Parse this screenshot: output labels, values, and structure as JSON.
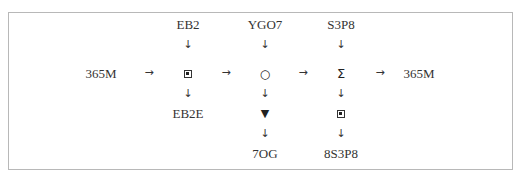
{
  "diagram": {
    "title_strip": "",
    "frame": {
      "border_color": "#b8b8b8"
    },
    "top_inputs": [
      {
        "id": "in-ebox",
        "label": "EB2"
      },
      {
        "id": "in-circle",
        "label": "YGO7"
      },
      {
        "id": "in-sigma",
        "label": "S3P8"
      }
    ],
    "main_row": {
      "start_label": "365M",
      "end_label": "365M",
      "nodes": [
        {
          "id": "node-square",
          "symbol": "square-dot",
          "glyph": "▣"
        },
        {
          "id": "node-circle",
          "symbol": "circle",
          "glyph": "○"
        },
        {
          "id": "node-sigma",
          "symbol": "sigma",
          "glyph": "Σ"
        }
      ],
      "arrow_glyph": "→"
    },
    "down_arrow_glyph": "↓",
    "second_row": [
      {
        "id": "out-ebox",
        "label": "EB2E"
      },
      {
        "id": "node-triangle",
        "symbol": "triangle-down",
        "glyph": "▼"
      },
      {
        "id": "node-square2",
        "symbol": "square-dot",
        "glyph": "▣"
      }
    ],
    "bottom_outputs": [
      {
        "id": "out-triangle",
        "label": "7OG"
      },
      {
        "id": "out-square2",
        "label": "8S3P8"
      }
    ]
  }
}
